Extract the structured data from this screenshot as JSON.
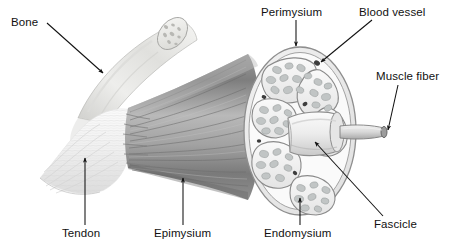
{
  "figure": {
    "style": "grayscale pencil illustration",
    "width": 452,
    "height": 248,
    "background_color": "#ffffff"
  },
  "labels": [
    {
      "id": "bone",
      "text": "Bone",
      "pointer": "line",
      "target": "bone shaft"
    },
    {
      "id": "perimysium",
      "text": "Perimysium",
      "pointer": "arrow",
      "target": "connective sheath around fascicle"
    },
    {
      "id": "blood_vessel",
      "text": "Blood vessel",
      "pointer": "arrow",
      "target": "vessel between fascicles"
    },
    {
      "id": "muscle_fiber",
      "text": "Muscle fiber",
      "pointer": "arrow",
      "target": "single fiber tip"
    },
    {
      "id": "fascicle",
      "text": "Fascicle",
      "pointer": "arrow",
      "target": "central extracted fascicle"
    },
    {
      "id": "endomysium",
      "text": "Endomysium",
      "pointer": "arrow",
      "target": "sheath around muscle fibers"
    },
    {
      "id": "epimysium",
      "text": "Epimysium",
      "pointer": "arrow",
      "target": "outer sheath of muscle belly"
    },
    {
      "id": "tendon",
      "text": "Tendon",
      "pointer": "arrow",
      "target": "tendon band"
    }
  ],
  "anatomy": {
    "parts": [
      {
        "name": "bone",
        "description": "cut cylindrical bone angled to upper right with speckled trabecular cut end"
      },
      {
        "name": "tendon",
        "description": "pale fibrous band joining bone to muscle belly"
      },
      {
        "name": "muscle_belly",
        "description": "gray striated muscle fanning out to the right"
      },
      {
        "name": "cross_section",
        "description": "oval cut face showing fascicles"
      },
      {
        "name": "fascicle",
        "description": "central fascicle cylinder projecting to the right"
      },
      {
        "name": "muscle_fiber",
        "description": "thin fiber tube projecting from the fascicle"
      }
    ],
    "fascicle_count": 7
  },
  "colors": {
    "ink": "#111111",
    "outline": "#555555",
    "fascicle_fill": "#f1f1f1",
    "fiber_fill": "#bfc3c3",
    "muscle_dark": "#8a8a8a",
    "muscle_light": "#c9c9c9",
    "tendon": "#f6f6f6",
    "bone": "#e4e4e2",
    "background": "#ffffff"
  }
}
